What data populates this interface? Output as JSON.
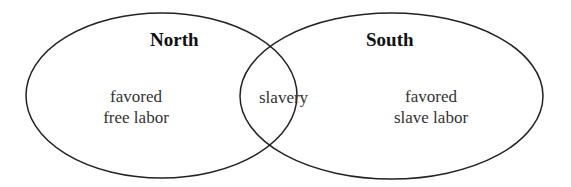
{
  "diagram": {
    "type": "venn",
    "stroke_color": "#222222",
    "background": "#ffffff",
    "sets": [
      {
        "id": "north",
        "title": "North",
        "line1": "favored",
        "line2": "free labor"
      },
      {
        "id": "south",
        "title": "South",
        "line1": "favored",
        "line2": "slave labor"
      }
    ],
    "intersection": {
      "label": "slavery"
    }
  }
}
